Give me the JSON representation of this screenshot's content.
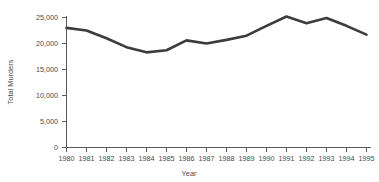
{
  "chart_data": {
    "type": "line",
    "title": "",
    "xlabel": "Year",
    "ylabel": "Total Murders",
    "x": [
      1980,
      1981,
      1982,
      1983,
      1984,
      1985,
      1986,
      1987,
      1988,
      1989,
      1990,
      1991,
      1992,
      1993,
      1994,
      1995
    ],
    "categories": [
      "1980",
      "1981",
      "1982",
      "1983",
      "1984",
      "1985",
      "1986",
      "1987",
      "1988",
      "1989",
      "1990",
      "1991",
      "1992",
      "1993",
      "1994",
      "1995"
    ],
    "series": [
      {
        "name": "Total Murders",
        "values": [
          23000,
          22500,
          21000,
          19300,
          18300,
          18700,
          20600,
          20000,
          20700,
          21500,
          23400,
          25200,
          23900,
          24900,
          23400,
          21700
        ]
      }
    ],
    "values": [
      23000,
      22500,
      21000,
      19300,
      18300,
      18700,
      20600,
      20000,
      20700,
      21500,
      23400,
      25200,
      23900,
      24900,
      23400,
      21700
    ],
    "ylim": [
      0,
      25000
    ],
    "xlim": [
      1980,
      1995
    ],
    "yticks": [
      0,
      5000,
      10000,
      15000,
      20000,
      25000
    ],
    "ytick_labels": [
      "0",
      "5,000",
      "10,000",
      "15,000",
      "20,000",
      "25,000"
    ],
    "xtick_labels": [
      "1980",
      "1981",
      "1982",
      "1983",
      "1984",
      "1985",
      "1986",
      "1987",
      "1988",
      "1989",
      "1990",
      "1991",
      "1992",
      "1993",
      "1994",
      "1995"
    ],
    "grid": false,
    "legend": "none",
    "line_color": "#3c3c3c",
    "axis_color": "#5a5a5a",
    "text_color": "#4a4a4a",
    "background": "#ffffff"
  },
  "axes": {
    "y_title": "Total Murders",
    "x_title": "Year"
  }
}
